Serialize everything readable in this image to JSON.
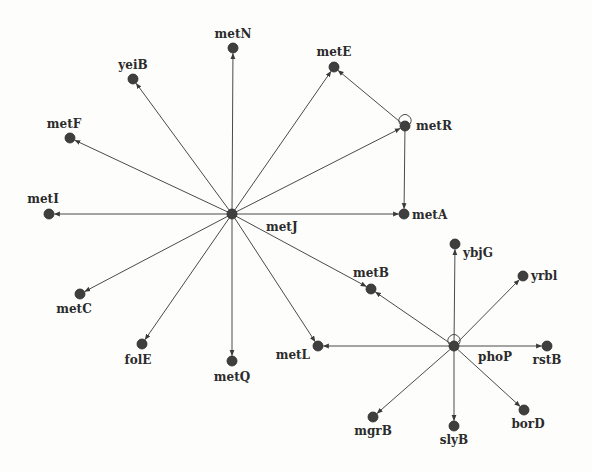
{
  "diagram": {
    "type": "gene-regulatory-network",
    "colors": {
      "node": "#3f3f3f",
      "edge": "#4a4a4a",
      "label": "#2b2b2b",
      "background": "#fdfdfc"
    },
    "nodes": [
      {
        "id": "metJ",
        "label": "metJ",
        "x": 232,
        "y": 214,
        "lx": 266,
        "ly": 231,
        "anchor": "start",
        "hub": true
      },
      {
        "id": "metN",
        "label": "metN",
        "x": 233,
        "y": 48,
        "lx": 233,
        "ly": 38,
        "anchor": "middle"
      },
      {
        "id": "yeiB",
        "label": "yeiB",
        "x": 133,
        "y": 79,
        "lx": 133,
        "ly": 69,
        "anchor": "middle"
      },
      {
        "id": "metE",
        "label": "metE",
        "x": 334,
        "y": 67,
        "lx": 334,
        "ly": 56,
        "anchor": "middle"
      },
      {
        "id": "metF",
        "label": "metF",
        "x": 70,
        "y": 138,
        "lx": 64,
        "ly": 128,
        "anchor": "middle"
      },
      {
        "id": "metR",
        "label": "metR",
        "x": 405,
        "y": 126,
        "lx": 416,
        "ly": 130,
        "anchor": "start",
        "self_loop": true
      },
      {
        "id": "metI",
        "label": "metI",
        "x": 49,
        "y": 214,
        "lx": 43,
        "ly": 203,
        "anchor": "middle"
      },
      {
        "id": "metA",
        "label": "metA",
        "x": 404,
        "y": 214,
        "lx": 412,
        "ly": 219,
        "anchor": "start"
      },
      {
        "id": "metC",
        "label": "metC",
        "x": 80,
        "y": 294,
        "lx": 74,
        "ly": 313,
        "anchor": "middle"
      },
      {
        "id": "folE",
        "label": "folE",
        "x": 142,
        "y": 344,
        "lx": 138,
        "ly": 364,
        "anchor": "middle"
      },
      {
        "id": "metQ",
        "label": "metQ",
        "x": 232,
        "y": 361,
        "lx": 232,
        "ly": 381,
        "anchor": "middle"
      },
      {
        "id": "metB",
        "label": "metB",
        "x": 371,
        "y": 289,
        "lx": 371,
        "ly": 277,
        "anchor": "middle"
      },
      {
        "id": "metL",
        "label": "metL",
        "x": 318,
        "y": 346,
        "lx": 310,
        "ly": 359,
        "anchor": "end"
      },
      {
        "id": "phoP",
        "label": "phoP",
        "x": 454,
        "y": 346,
        "lx": 478,
        "ly": 361,
        "anchor": "start",
        "hub": true,
        "self_loop": true
      },
      {
        "id": "ybjG",
        "label": "ybjG",
        "x": 455,
        "y": 244,
        "lx": 463,
        "ly": 257,
        "anchor": "start"
      },
      {
        "id": "yrbl",
        "label": "yrbl",
        "x": 523,
        "y": 276,
        "lx": 531,
        "ly": 280,
        "anchor": "start"
      },
      {
        "id": "rstB",
        "label": "rstB",
        "x": 547,
        "y": 346,
        "lx": 547,
        "ly": 364,
        "anchor": "middle"
      },
      {
        "id": "borD",
        "label": "borD",
        "x": 524,
        "y": 410,
        "lx": 528,
        "ly": 428,
        "anchor": "middle"
      },
      {
        "id": "mgrB",
        "label": "mgrB",
        "x": 373,
        "y": 417,
        "lx": 373,
        "ly": 435,
        "anchor": "middle"
      },
      {
        "id": "slyB",
        "label": "slyB",
        "x": 454,
        "y": 426,
        "lx": 454,
        "ly": 444,
        "anchor": "middle"
      }
    ],
    "edges": [
      {
        "from": "metJ",
        "to": "metN"
      },
      {
        "from": "metJ",
        "to": "yeiB"
      },
      {
        "from": "metJ",
        "to": "metE"
      },
      {
        "from": "metJ",
        "to": "metF"
      },
      {
        "from": "metJ",
        "to": "metR"
      },
      {
        "from": "metJ",
        "to": "metI"
      },
      {
        "from": "metJ",
        "to": "metA"
      },
      {
        "from": "metJ",
        "to": "metC"
      },
      {
        "from": "metJ",
        "to": "folE"
      },
      {
        "from": "metJ",
        "to": "metQ"
      },
      {
        "from": "metJ",
        "to": "metB"
      },
      {
        "from": "metJ",
        "to": "metL"
      },
      {
        "from": "metR",
        "to": "metE"
      },
      {
        "from": "metR",
        "to": "metA"
      },
      {
        "from": "phoP",
        "to": "ybjG"
      },
      {
        "from": "phoP",
        "to": "yrbl"
      },
      {
        "from": "phoP",
        "to": "rstB"
      },
      {
        "from": "phoP",
        "to": "borD"
      },
      {
        "from": "phoP",
        "to": "slyB"
      },
      {
        "from": "phoP",
        "to": "mgrB"
      },
      {
        "from": "phoP",
        "to": "metL"
      },
      {
        "from": "phoP",
        "to": "metB"
      }
    ]
  }
}
